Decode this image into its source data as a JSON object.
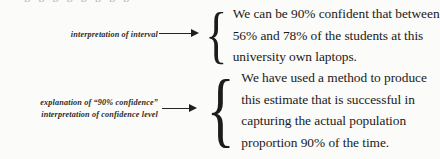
{
  "page": {
    "background_color": "#fbfbf9",
    "ink_color": "#1a1a1a",
    "cropped_top_line_artifact": "p p p  p  p     p    p      p"
  },
  "annotations": [
    {
      "name": "interpretation-of-interval",
      "lines": [
        "interpretation of interval"
      ],
      "arrow": "right-arrow"
    },
    {
      "name": "explanation-of-confidence-level",
      "lines": [
        "explanation of “90% confidence”",
        "interpretation of confidence level"
      ],
      "arrow": "right-arrow"
    }
  ],
  "blocks": [
    {
      "name": "interval-interpretation-statement",
      "brace": "{",
      "lines": [
        "We can be 90% confident that between",
        "56% and 78% of the students at this",
        "university own laptops."
      ]
    },
    {
      "name": "confidence-level-interpretation-statement",
      "brace": "{",
      "lines": [
        "We have used a method to produce",
        "this estimate that is successful in",
        "capturing the actual population",
        "proportion 90% of the time."
      ]
    }
  ]
}
